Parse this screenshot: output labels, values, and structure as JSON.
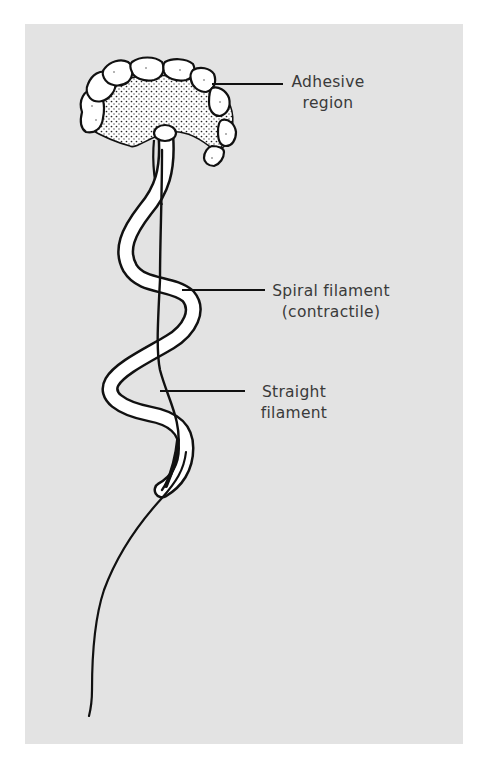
{
  "figure": {
    "type": "labeled biological illustration",
    "colors": {
      "panel_background": "#e3e3e3",
      "ink": "#111111",
      "label_text": "#3a3a3a",
      "fill_white": "#ffffff"
    }
  },
  "labels": {
    "adhesive": {
      "line1": "Adhesive",
      "line2": "region"
    },
    "spiral": {
      "line1": "Spiral filament",
      "line2": "(contractile)"
    },
    "straight": {
      "line1": "Straight",
      "line2": "filament"
    }
  }
}
